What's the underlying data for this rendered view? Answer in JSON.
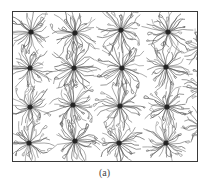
{
  "figure": {
    "caption": "(a)",
    "frame": {
      "x": 12,
      "y": 11,
      "width": 186,
      "height": 151
    },
    "style": {
      "frame_color": "#3a3a3a",
      "arm_color": "#5a5a5a",
      "core_color": "#1a1a1a",
      "background": "#ffffff"
    },
    "stars": [
      {
        "cx": 31,
        "cy": 32,
        "arms": 34,
        "length": 22
      },
      {
        "cx": 75,
        "cy": 33,
        "arms": 34,
        "length": 24
      },
      {
        "cx": 121,
        "cy": 30,
        "arms": 34,
        "length": 23
      },
      {
        "cx": 168,
        "cy": 32,
        "arms": 34,
        "length": 22
      },
      {
        "cx": 30,
        "cy": 68,
        "arms": 32,
        "length": 21
      },
      {
        "cx": 74,
        "cy": 68,
        "arms": 34,
        "length": 23
      },
      {
        "cx": 122,
        "cy": 68,
        "arms": 34,
        "length": 24
      },
      {
        "cx": 166,
        "cy": 67,
        "arms": 34,
        "length": 22
      },
      {
        "cx": 30,
        "cy": 107,
        "arms": 32,
        "length": 21
      },
      {
        "cx": 73,
        "cy": 105,
        "arms": 34,
        "length": 24
      },
      {
        "cx": 120,
        "cy": 106,
        "arms": 34,
        "length": 24
      },
      {
        "cx": 167,
        "cy": 107,
        "arms": 34,
        "length": 22
      },
      {
        "cx": 29,
        "cy": 143,
        "arms": 32,
        "length": 21
      },
      {
        "cx": 75,
        "cy": 141,
        "arms": 34,
        "length": 23
      },
      {
        "cx": 119,
        "cy": 143,
        "arms": 34,
        "length": 23
      },
      {
        "cx": 166,
        "cy": 143,
        "arms": 34,
        "length": 22
      },
      {
        "cx": 200,
        "cy": 48,
        "arms": 24,
        "length": 18
      },
      {
        "cx": 202,
        "cy": 88,
        "arms": 24,
        "length": 18
      },
      {
        "cx": 201,
        "cy": 126,
        "arms": 24,
        "length": 18
      }
    ]
  }
}
